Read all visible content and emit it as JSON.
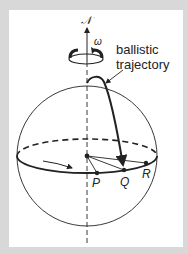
{
  "diagram": {
    "type": "rotating-earth-ballistic-trajectory",
    "labels": {
      "north_pole": "𝒩",
      "angular_velocity": "ω",
      "trajectory_line1": "ballistic",
      "trajectory_line2": "trajectory",
      "point_p": "P",
      "point_q": "Q",
      "point_r": "R"
    },
    "colors": {
      "background": "#d8d8d8",
      "panel": "#ffffff",
      "ink": "#222222"
    }
  }
}
